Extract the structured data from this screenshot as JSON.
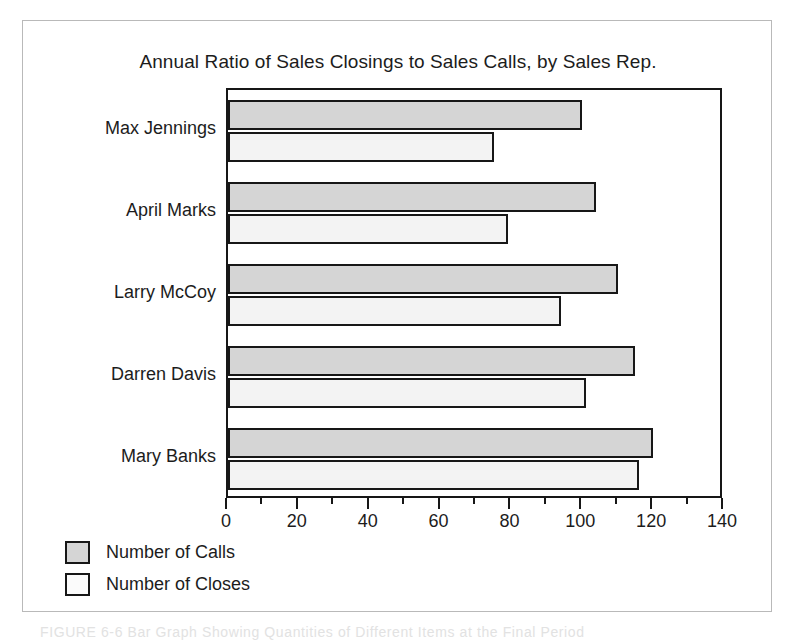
{
  "figure": {
    "caption": "FIGURE 6-6   Bar Graph Showing Quantities of Different Items at the Final Period"
  },
  "chart_data": {
    "type": "bar",
    "orientation": "horizontal",
    "title": "Annual Ratio of Sales Closings to Sales Calls, by Sales Rep.",
    "xlabel": "",
    "ylabel": "",
    "xlim": [
      0,
      140
    ],
    "grid": false,
    "legend_position": "below-left",
    "x_major_step": 20,
    "x_minor_step": 10,
    "tick_labels": [
      "0",
      "20",
      "40",
      "60",
      "80",
      "100",
      "120",
      "140"
    ],
    "tick_values": [
      0,
      20,
      40,
      60,
      80,
      100,
      120,
      140
    ],
    "categories": [
      "Max Jennings",
      "April Marks",
      "Larry McCoy",
      "Darren Davis",
      "Mary Banks"
    ],
    "series": [
      {
        "name": "Number of Calls",
        "color": "#d5d5d5",
        "values": [
          100,
          104,
          110,
          115,
          120
        ]
      },
      {
        "name": "Number of Closes",
        "color": "#f3f3f3",
        "values": [
          75,
          79,
          94,
          101,
          116
        ]
      }
    ]
  }
}
